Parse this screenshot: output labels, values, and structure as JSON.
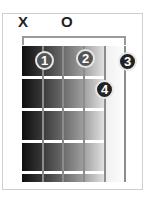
{
  "chord": {
    "string_markers": [
      {
        "string": 1,
        "symbol": "X"
      },
      {
        "string": 3,
        "symbol": "O"
      }
    ],
    "fingers": [
      {
        "label": "1",
        "string": 2,
        "fret": 1
      },
      {
        "label": "2",
        "string": 4,
        "fret": 1
      },
      {
        "label": "3",
        "string": 6,
        "fret": 1
      },
      {
        "label": "4",
        "string": 5,
        "fret": 2
      }
    ]
  }
}
